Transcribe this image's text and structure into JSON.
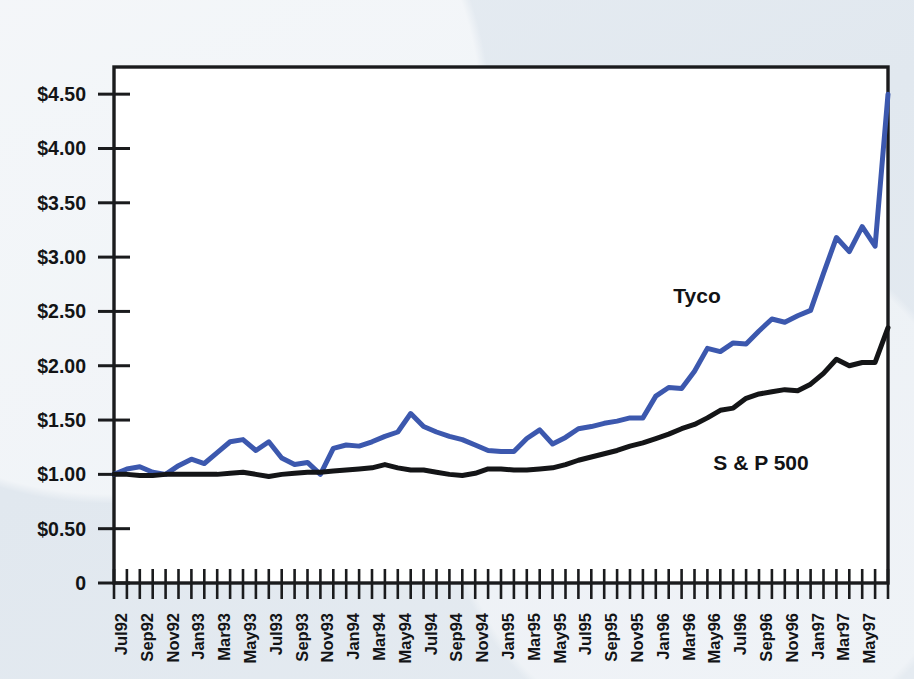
{
  "page": {
    "background_color": "#e3e9f0",
    "plot_background_color": "#ffffff",
    "frame_color": "#1a1b1d"
  },
  "labels": {
    "tyco": "Tyco",
    "sp500": "S & P 500"
  },
  "chart_data": {
    "type": "line",
    "title": "",
    "subtitle": "",
    "xlabel": "",
    "ylabel": "",
    "grid": false,
    "legend_position": "inline-annotation",
    "ylim": [
      0,
      4.75
    ],
    "y_ticks": [
      0,
      0.5,
      1.0,
      1.5,
      2.0,
      2.5,
      3.0,
      3.5,
      4.0,
      4.5
    ],
    "y_tick_labels": [
      "0",
      "$0.50",
      "$1.00",
      "$1.50",
      "$2.00",
      "$2.50",
      "$3.00",
      "$3.50",
      "$4.00",
      "$4.50"
    ],
    "x_tick_labels": [
      "Jul92",
      "Sep92",
      "Nov92",
      "Jan93",
      "Mar93",
      "May93",
      "Jul93",
      "Sep93",
      "Nov93",
      "Jan94",
      "Mar94",
      "May94",
      "Jul94",
      "Sep94",
      "Nov94",
      "Jan95",
      "Mar95",
      "May95",
      "Jul95",
      "Sep95",
      "Nov95",
      "Jan96",
      "Mar96",
      "May96",
      "Jul96",
      "Sep96",
      "Nov96",
      "Jan97",
      "Mar97",
      "May97"
    ],
    "x_minor_tick_count": 61,
    "series": [
      {
        "name": "Tyco",
        "color": "#3c58ae",
        "line_width": 5,
        "values": [
          1.0,
          1.05,
          1.07,
          1.02,
          1.0,
          1.08,
          1.14,
          1.1,
          1.2,
          1.3,
          1.32,
          1.22,
          1.3,
          1.15,
          1.09,
          1.11,
          1.0,
          1.24,
          1.27,
          1.26,
          1.3,
          1.35,
          1.39,
          1.56,
          1.44,
          1.39,
          1.35,
          1.32,
          1.27,
          1.22,
          1.21,
          1.21,
          1.33,
          1.41,
          1.28,
          1.34,
          1.42,
          1.44,
          1.47,
          1.49,
          1.52,
          1.52,
          1.72,
          1.8,
          1.79,
          1.95,
          2.16,
          2.13,
          2.21,
          2.2,
          2.32,
          2.43,
          2.4,
          2.46,
          2.51,
          2.85,
          3.18,
          3.05,
          3.28,
          3.1,
          4.5
        ]
      },
      {
        "name": "S & P 500",
        "color": "#141517",
        "line_width": 5,
        "values": [
          1.0,
          1.0,
          0.99,
          0.99,
          1.0,
          1.0,
          1.0,
          1.0,
          1.0,
          1.01,
          1.02,
          1.0,
          0.98,
          1.0,
          1.01,
          1.02,
          1.02,
          1.03,
          1.04,
          1.05,
          1.06,
          1.09,
          1.06,
          1.04,
          1.04,
          1.02,
          1.0,
          0.99,
          1.01,
          1.05,
          1.05,
          1.04,
          1.04,
          1.05,
          1.06,
          1.09,
          1.13,
          1.16,
          1.19,
          1.22,
          1.26,
          1.29,
          1.33,
          1.37,
          1.42,
          1.46,
          1.52,
          1.59,
          1.61,
          1.7,
          1.74,
          1.76,
          1.78,
          1.77,
          1.83,
          1.93,
          2.06,
          2.0,
          2.03,
          2.03,
          2.35
        ]
      }
    ]
  }
}
